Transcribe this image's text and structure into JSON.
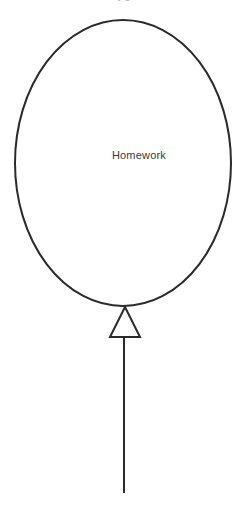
{
  "diagram": {
    "type": "balloon-diagram",
    "background_color": "#ffffff",
    "stroke_color": "#2a2a2a",
    "stroke_width": 2,
    "balloon": {
      "label": "Homework",
      "label_color": "#3a3a3a",
      "shape": "ellipse",
      "center_x": 123,
      "center_y": 163,
      "radius_x": 108,
      "radius_y": 143,
      "fill": "none"
    },
    "knot": {
      "name": "triangle-knot",
      "shape": "triangle-up",
      "apex_x": 125,
      "apex_y": 307,
      "base_left_x": 110,
      "base_right_x": 140,
      "base_y": 337,
      "fill": "none"
    },
    "string": {
      "name": "balloon-string",
      "x": 124,
      "top_y": 337,
      "bottom_y": 493
    }
  },
  "top_clipped_text": {
    "fragment": "y g"
  }
}
